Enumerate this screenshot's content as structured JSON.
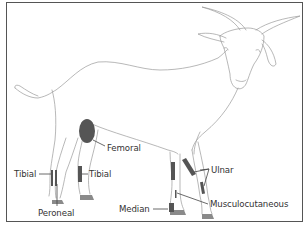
{
  "diagram": {
    "colors": {
      "outline": "#9a9a9a",
      "nerve_marker": "#555555",
      "hoof": "#8a8a8a",
      "label_text": "#333333",
      "border": "#555555"
    },
    "labels": [
      {
        "id": "tibial-hind-left",
        "text": "Tibial"
      },
      {
        "id": "tibial-hind-right",
        "text": "Tibial"
      },
      {
        "id": "peroneal",
        "text": "Peroneal"
      },
      {
        "id": "femoral",
        "text": "Femoral"
      },
      {
        "id": "ulnar",
        "text": "Ulnar"
      },
      {
        "id": "median",
        "text": "Median"
      },
      {
        "id": "musculocutaneous",
        "text": "Musculocutaneous"
      }
    ]
  }
}
